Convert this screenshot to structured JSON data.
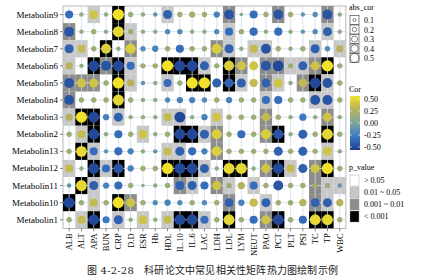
{
  "caption": "图 4-2-28　科研论文中常见相关性矩阵热力图绘制示例",
  "chart_data": {
    "type": "heatmap",
    "title": "",
    "xlabel": "",
    "ylabel": "",
    "grid": true,
    "legend_position": "right",
    "rows": [
      "Metabolin9",
      "Metabolin8",
      "Metabolin7",
      "Metabolin6",
      "Metabolin5",
      "Metabolin4",
      "Metabolin3",
      "Metabolin2",
      "Metabolin13",
      "Metabolin12",
      "Metabolin11",
      "Metabolin10",
      "Metabolin1"
    ],
    "columns": [
      "ALB",
      "ALT",
      "APA",
      "BUN",
      "CRP",
      "D.D",
      "ESR",
      "Hb",
      "HDL",
      "IL.10",
      "IL.6",
      "LAC",
      "LDH",
      "LDL",
      "LYM",
      "NEUT",
      "PAO",
      "PCT",
      "PLT",
      "PSI",
      "TC",
      "TP",
      "WBC"
    ],
    "cor": [
      [
        -0.3,
        0.1,
        0.35,
        0.1,
        0.5,
        0.15,
        0.1,
        -0.1,
        -0.35,
        0.15,
        0.2,
        0.15,
        -0.2,
        -0.4,
        0.05,
        -0.3,
        0.15,
        -0.4,
        0.15,
        -0.1,
        -0.15,
        -0.4,
        0.1
      ],
      [
        -0.4,
        0.1,
        0.15,
        0.1,
        0.45,
        0.15,
        0.1,
        0.1,
        -0.15,
        -0.15,
        0.1,
        0.1,
        -0.15,
        -0.3,
        0.15,
        -0.3,
        0.1,
        -0.3,
        0.1,
        -0.1,
        -0.15,
        -0.35,
        0.1
      ],
      [
        -0.35,
        0.3,
        0.15,
        0.4,
        0.1,
        0.4,
        -0.15,
        -0.2,
        0.15,
        -0.3,
        0.15,
        0.15,
        0.4,
        -0.35,
        0.1,
        0.3,
        -0.4,
        0.15,
        0.1,
        0.15,
        -0.35,
        -0.15,
        0.25
      ],
      [
        0.25,
        0.1,
        -0.45,
        -0.4,
        -0.45,
        -0.3,
        0.15,
        0.15,
        0.5,
        -0.45,
        -0.45,
        -0.35,
        0.15,
        0.4,
        0.35,
        0.35,
        -0.4,
        -0.45,
        0.15,
        -0.35,
        0.35,
        0.5,
        0.15
      ],
      [
        -0.4,
        0.35,
        0.35,
        0.15,
        0.5,
        0.25,
        -0.1,
        0.1,
        -0.3,
        0.15,
        0.5,
        0.5,
        -0.35,
        -0.35,
        -0.35,
        0.3,
        -0.35,
        0.35,
        0.1,
        0.3,
        -0.45,
        -0.4,
        0.15
      ],
      [
        -0.4,
        0.15,
        0.15,
        0.15,
        0.45,
        0.15,
        0.1,
        0.1,
        -0.15,
        -0.2,
        -0.2,
        -0.15,
        0.15,
        -0.2,
        0.15,
        0.15,
        -0.3,
        -0.3,
        0.15,
        0.15,
        -0.4,
        -0.4,
        0.15
      ],
      [
        0.25,
        0.5,
        -0.45,
        -0.2,
        -0.35,
        0.1,
        0.1,
        0.1,
        0.3,
        -0.45,
        0.1,
        -0.2,
        0.35,
        0.15,
        0.15,
        0.15,
        0.3,
        0.15,
        0.1,
        -0.25,
        0.1,
        0.35,
        0.1
      ],
      [
        0.15,
        0.3,
        -0.45,
        0.1,
        -0.3,
        0.15,
        0.35,
        0.1,
        0.15,
        -0.45,
        -0.45,
        -0.35,
        0.4,
        0.15,
        -0.3,
        0.15,
        0.4,
        -0.4,
        0.1,
        -0.35,
        0.15,
        0.45,
        0.15
      ],
      [
        0.15,
        0.45,
        -0.3,
        -0.1,
        -0.3,
        -0.2,
        0.1,
        -0.1,
        0.3,
        -0.35,
        -0.3,
        -0.2,
        0.4,
        0.15,
        0.15,
        0.15,
        0.15,
        -0.35,
        0.15,
        -0.35,
        0.15,
        0.35,
        0.1
      ],
      [
        0.3,
        0.1,
        -0.45,
        -0.3,
        -0.4,
        -0.2,
        0.15,
        0.15,
        0.5,
        -0.45,
        -0.45,
        -0.35,
        0.1,
        0.45,
        0.45,
        0.1,
        0.35,
        -0.45,
        0.3,
        -0.35,
        0.35,
        0.5,
        0.15
      ],
      [
        -0.1,
        0.45,
        -0.35,
        -0.2,
        -0.3,
        0.15,
        0.05,
        0.1,
        0.15,
        -0.35,
        -0.35,
        -0.3,
        0.35,
        0.15,
        0.25,
        -0.3,
        0.15,
        -0.4,
        0.15,
        0.15,
        0.15,
        0.15,
        -0.1
      ],
      [
        -0.45,
        0.15,
        0.3,
        0.15,
        0.5,
        0.35,
        0.15,
        -0.15,
        -0.2,
        -0.15,
        0.15,
        -0.15,
        0.15,
        -0.35,
        -0.2,
        0.3,
        -0.35,
        0.15,
        0.15,
        0.25,
        -0.35,
        -0.35,
        0.25
      ],
      [
        0.15,
        0.3,
        -0.45,
        -0.25,
        -0.35,
        0.1,
        0.35,
        0.1,
        0.3,
        -0.45,
        -0.45,
        -0.3,
        0.15,
        0.45,
        0.15,
        -0.3,
        0.35,
        -0.45,
        0.15,
        -0.3,
        0.45,
        0.45,
        0.15
      ]
    ],
    "p_level": [
      [
        0,
        0,
        1,
        0,
        3,
        0,
        0,
        0,
        1,
        0,
        0,
        0,
        0,
        2,
        0,
        0,
        0,
        2,
        0,
        0,
        0,
        2,
        0
      ],
      [
        2,
        0,
        0,
        0,
        3,
        1,
        0,
        0,
        0,
        0,
        0,
        0,
        0,
        1,
        0,
        0,
        0,
        0,
        0,
        0,
        0,
        1,
        0
      ],
      [
        1,
        1,
        0,
        3,
        0,
        2,
        0,
        0,
        0,
        0,
        0,
        0,
        2,
        1,
        0,
        1,
        1,
        0,
        0,
        0,
        1,
        0,
        1
      ],
      [
        1,
        0,
        3,
        2,
        3,
        1,
        0,
        0,
        3,
        3,
        3,
        1,
        0,
        3,
        2,
        0,
        2,
        2,
        1,
        1,
        2,
        3,
        0
      ],
      [
        2,
        2,
        2,
        0,
        3,
        1,
        0,
        0,
        1,
        0,
        3,
        3,
        0,
        3,
        1,
        0,
        2,
        1,
        0,
        2,
        3,
        1,
        0
      ],
      [
        2,
        0,
        0,
        0,
        3,
        0,
        0,
        0,
        0,
        0,
        0,
        0,
        0,
        0,
        0,
        0,
        1,
        0,
        0,
        0,
        1,
        1,
        0
      ],
      [
        1,
        3,
        3,
        0,
        1,
        0,
        0,
        0,
        1,
        1,
        0,
        0,
        1,
        0,
        0,
        0,
        2,
        0,
        0,
        0,
        0,
        2,
        0
      ],
      [
        0,
        1,
        3,
        0,
        0,
        0,
        1,
        0,
        0,
        3,
        3,
        1,
        2,
        0,
        0,
        0,
        2,
        3,
        0,
        0,
        0,
        3,
        0
      ],
      [
        0,
        3,
        1,
        0,
        0,
        0,
        0,
        0,
        1,
        1,
        0,
        0,
        2,
        0,
        0,
        0,
        0,
        0,
        0,
        0,
        0,
        1,
        0
      ],
      [
        1,
        0,
        3,
        1,
        3,
        0,
        0,
        0,
        3,
        3,
        3,
        1,
        0,
        3,
        3,
        0,
        2,
        3,
        1,
        0,
        2,
        3,
        0
      ],
      [
        0,
        3,
        1,
        0,
        0,
        0,
        0,
        0,
        0,
        2,
        1,
        0,
        2,
        1,
        0,
        1,
        0,
        0,
        0,
        0,
        2,
        1,
        1
      ],
      [
        3,
        0,
        1,
        0,
        3,
        2,
        0,
        0,
        0,
        0,
        0,
        0,
        0,
        2,
        0,
        0,
        1,
        0,
        0,
        0,
        2,
        1,
        0
      ],
      [
        0,
        1,
        3,
        0,
        1,
        0,
        1,
        0,
        1,
        3,
        3,
        1,
        0,
        3,
        0,
        0,
        2,
        3,
        0,
        0,
        3,
        3,
        0
      ]
    ],
    "colorbar": {
      "title": "Cor",
      "ticks": [
        "0.50",
        "0.25",
        "0.00",
        "-0.25",
        "-0.50"
      ],
      "range": [
        -0.5,
        0.5
      ]
    },
    "size_legend": {
      "title": "abs_cor",
      "labels": [
        "0.1",
        "0.2",
        "0.3",
        "0.4",
        "0.5"
      ]
    },
    "p_legend": {
      "title": "p_value",
      "labels": [
        "> 0.05",
        "0.01 ~ 0.05",
        "0.001 ~ 0.01",
        "< 0.001"
      ],
      "colors": [
        "#ffffff",
        "#c8c8c8",
        "#8c8c8c",
        "#000000"
      ]
    }
  }
}
